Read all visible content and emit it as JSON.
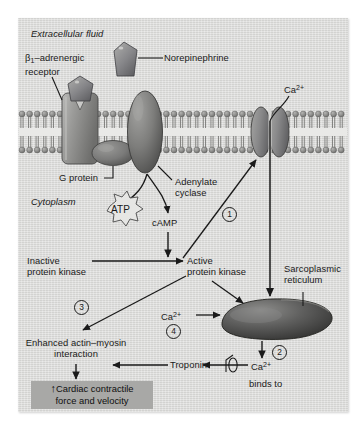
{
  "figure": {
    "background_color": "#d8d8d6",
    "result_box_color": "#a8a8a6",
    "ink_color": "#1a1a1a"
  },
  "compartments": {
    "extracellular": "Extracellular fluid",
    "cytoplasm": "Cytoplasm"
  },
  "labels": {
    "norepinephrine": "Norepinephrine",
    "receptor_line1": "β",
    "receptor_sub": "1",
    "receptor_line1_rest": "–adrenergic",
    "receptor_line2": "receptor",
    "g_protein": "G protein",
    "adenylate_line1": "Adenylate",
    "adenylate_line2": "cyclase",
    "atp": "ATP",
    "camp": "cAMP",
    "inactive_line1": "Inactive",
    "inactive_line2": "protein kinase",
    "active_line1": "Active",
    "active_line2": "protein kinase",
    "calcium": "Ca",
    "calcium_charge": "2+",
    "sarcoplasmic_line1": "Sarcoplasmic",
    "sarcoplasmic_line2": "reticulum",
    "troponin": "Troponin",
    "binds_to": "binds to",
    "enhanced_line1": "Enhanced actin–myosin",
    "enhanced_line2": "interaction",
    "result_line1": "Cardiac contractile",
    "result_line2": "force and velocity",
    "result_arrow": "↑"
  },
  "steps": [
    {
      "id": "1",
      "label": "①",
      "text": "1"
    },
    {
      "id": "2",
      "label": "②",
      "text": "2"
    },
    {
      "id": "3",
      "label": "③",
      "text": "3"
    },
    {
      "id": "4",
      "label": "④",
      "text": "4"
    }
  ],
  "ca_instances": {
    "membrane": "Ca",
    "sr_release": "Ca",
    "cytosolic": "Ca",
    "charge": "2+"
  },
  "structures": {
    "membrane": "phospholipid-bilayer",
    "receptor": "receptor-protein",
    "ligand": "norepinephrine-ligand",
    "g_protein": "g-protein-subunit",
    "adenylate_cyclase": "adenylate-cyclase-enzyme",
    "calcium_channel": "calcium-channel",
    "sarcoplasmic_reticulum": "sarcoplasmic-reticulum",
    "atp_burst": "atp-starburst"
  }
}
